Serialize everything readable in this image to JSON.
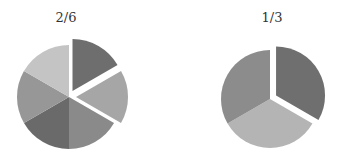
{
  "chart_data": [
    {
      "type": "pie",
      "title": "2/6",
      "categories": [
        "Slice 1",
        "Slice 2",
        "Slice 3",
        "Slice 4",
        "Slice 5",
        "Slice 6"
      ],
      "values": [
        1,
        1,
        1,
        1,
        1,
        1
      ],
      "exploded": [
        true,
        true,
        false,
        false,
        false,
        false
      ],
      "colors": [
        "#6e6e6e",
        "#a6a6a6",
        "#8a8a8a",
        "#6a6a6a",
        "#979797",
        "#c4c4c4"
      ],
      "start_angle_deg": 0,
      "direction": "clockwise",
      "center": [
        69,
        97
      ],
      "radius": 52,
      "explode_offset": 7,
      "title_pos": [
        66,
        22
      ]
    },
    {
      "type": "pie",
      "title": "1/3",
      "categories": [
        "Slice 1",
        "Slice 2",
        "Slice 3"
      ],
      "values": [
        1,
        1,
        1
      ],
      "exploded": [
        true,
        false,
        false
      ],
      "colors": [
        "#6f6f6f",
        "#b4b4b4",
        "#8c8c8c"
      ],
      "start_angle_deg": 0,
      "direction": "clockwise",
      "center": [
        270,
        99
      ],
      "radius": 49,
      "explode_offset": 7,
      "title_pos": [
        272,
        22
      ]
    }
  ]
}
